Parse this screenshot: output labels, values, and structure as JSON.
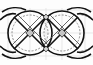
{
  "diagram": {
    "type": "interlaced-knot-pattern",
    "background": "#fdfdfd",
    "grid_color": "#d9d9d9",
    "stroke_color": "#111111",
    "inner_stroke_color": "#9a9a9a",
    "node_color": "#bdbdbd",
    "motifs": [
      {
        "cx": 30,
        "cy": 33,
        "r": 22
      },
      {
        "cx": 62,
        "cy": 33,
        "r": 22
      }
    ]
  }
}
